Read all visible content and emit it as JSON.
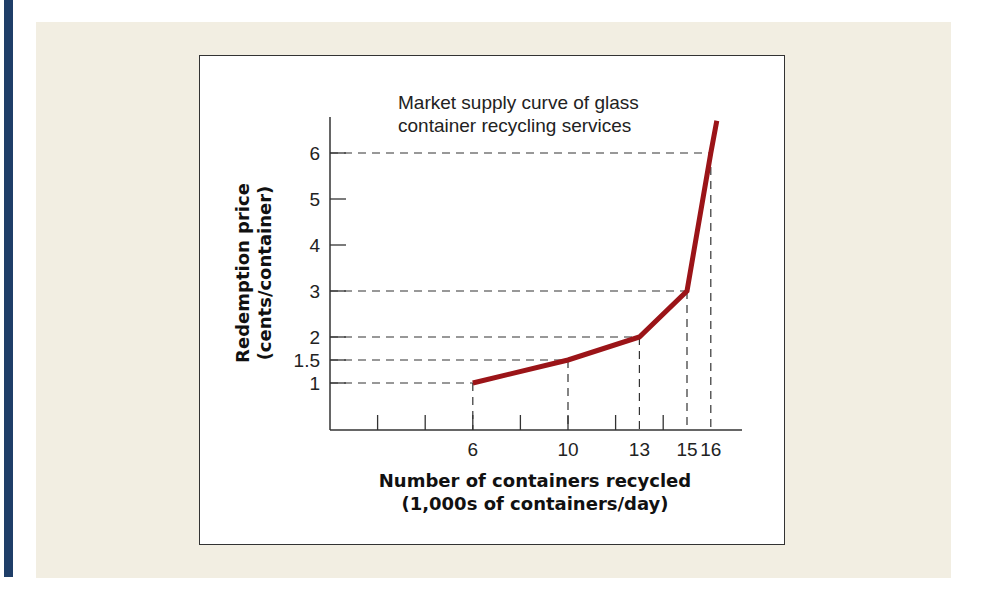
{
  "colors": {
    "side_bar": "#1f3e68",
    "panel": "#f2eee2",
    "curve": "#9b1418",
    "axis": "#333333"
  },
  "chart_data": {
    "type": "line",
    "title": "Market supply curve of glass container recycling services",
    "title_lines": [
      "Market supply curve of glass",
      "container recycling services"
    ],
    "xlabel": "Number of containers recycled (1,000s of containers/day)",
    "xlabel_lines": [
      "Number of containers recycled",
      "(1,000s of containers/day)"
    ],
    "ylabel": "Redemption price (cents/container)",
    "ylabel_lines": [
      "Redemption price",
      "(cents/container)"
    ],
    "series": [
      {
        "name": "Market supply curve",
        "x": [
          6,
          10,
          13,
          15,
          16,
          16.25
        ],
        "y": [
          1,
          1.5,
          2,
          3,
          6,
          6.7
        ]
      }
    ],
    "highlighted_points": [
      {
        "x": 6,
        "y": 1
      },
      {
        "x": 10,
        "y": 1.5
      },
      {
        "x": 13,
        "y": 2
      },
      {
        "x": 15,
        "y": 3
      },
      {
        "x": 16,
        "y": 6
      }
    ],
    "x_ticks": [
      2,
      4,
      6,
      8,
      10,
      12,
      14
    ],
    "x_tick_labels": [
      {
        "value": 6,
        "label": "6"
      },
      {
        "value": 10,
        "label": "10"
      },
      {
        "value": 13,
        "label": "13"
      },
      {
        "value": 15,
        "label": "15"
      },
      {
        "value": 16,
        "label": "16"
      }
    ],
    "y_ticks": [
      {
        "value": 1,
        "label": "1"
      },
      {
        "value": 1.5,
        "label": "1.5"
      },
      {
        "value": 2,
        "label": "2"
      },
      {
        "value": 3,
        "label": "3"
      },
      {
        "value": 4,
        "label": "4"
      },
      {
        "value": 5,
        "label": "5"
      },
      {
        "value": 6,
        "label": "6"
      }
    ],
    "xlim": [
      0,
      17.3
    ],
    "ylim": [
      0,
      6.9
    ],
    "grid": false,
    "legend": null,
    "guide_lines": "dashed"
  }
}
